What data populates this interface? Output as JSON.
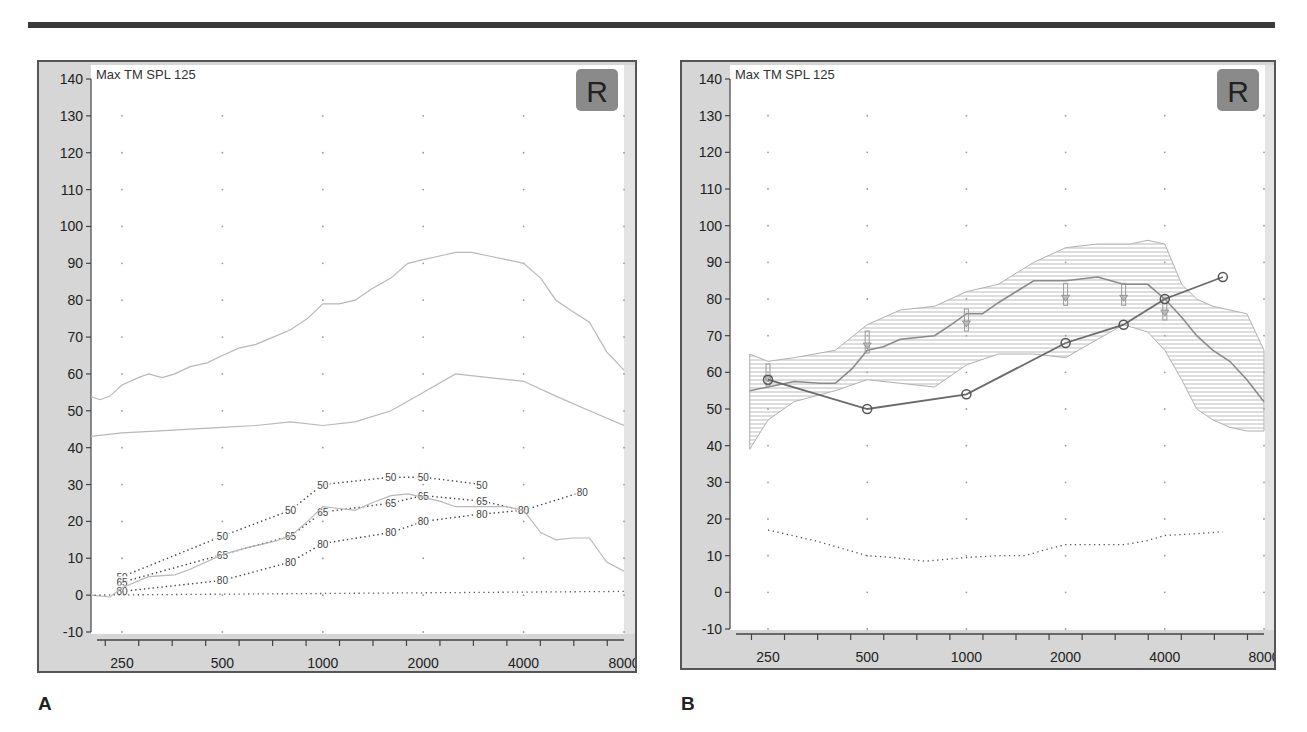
{
  "figure": {
    "panel_labels": [
      "A",
      "B"
    ]
  },
  "chart_data": [
    {
      "type": "line",
      "panel": "A",
      "title": "Max TM SPL 125",
      "badge": "R",
      "xlabel": "",
      "ylabel": "",
      "x_scale": "log2",
      "x_ticks": [
        250,
        500,
        1000,
        2000,
        4000,
        8000
      ],
      "y_ticks": [
        140,
        130,
        120,
        110,
        100,
        90,
        80,
        70,
        60,
        50,
        40,
        30,
        20,
        10,
        0,
        -10
      ],
      "ylim": [
        -10,
        140
      ],
      "grid": "dotted points",
      "series": [
        {
          "name": "upper-range",
          "style": "solid-light",
          "x": [
            200,
            215,
            230,
            250,
            280,
            300,
            330,
            360,
            400,
            450,
            500,
            560,
            630,
            710,
            800,
            900,
            1000,
            1120,
            1250,
            1400,
            1600,
            1800,
            2000,
            2240,
            2500,
            2800,
            3150,
            3550,
            4000,
            4500,
            5000,
            5600,
            6300,
            7100,
            8000
          ],
          "y": [
            54,
            53,
            54,
            57,
            59,
            60,
            59,
            60,
            62,
            63,
            65,
            67,
            68,
            70,
            72,
            75,
            79,
            79,
            80,
            83,
            86,
            90,
            91,
            92,
            93,
            93,
            92,
            91,
            90,
            86,
            80,
            77,
            74,
            66,
            61
          ]
        },
        {
          "name": "lower-range",
          "style": "solid-light",
          "x": [
            200,
            250,
            315,
            400,
            500,
            630,
            800,
            1000,
            1250,
            1600,
            2000,
            2500,
            3150,
            4000,
            5000,
            6300,
            8000
          ],
          "y": [
            43,
            44,
            44.5,
            45,
            45.5,
            46,
            47,
            46,
            47,
            50,
            55,
            60,
            59,
            58,
            54,
            50,
            46
          ]
        },
        {
          "name": "SPL 50",
          "style": "dotted-labeled",
          "label": "50",
          "x": [
            250,
            500,
            800,
            1000,
            1600,
            2000,
            3000
          ],
          "y": [
            5,
            16,
            23,
            30,
            32,
            32,
            30
          ]
        },
        {
          "name": "SPL 65",
          "style": "dotted-labeled",
          "label": "65",
          "x": [
            250,
            500,
            800,
            1000,
            1600,
            2000,
            3000,
            4000
          ],
          "y": [
            3.5,
            11,
            16,
            22.5,
            25,
            27,
            25.5,
            23
          ]
        },
        {
          "name": "SPL 80",
          "style": "dotted-labeled",
          "label": "80",
          "x": [
            250,
            500,
            800,
            1000,
            1600,
            2000,
            3000,
            4000,
            6000
          ],
          "y": [
            1,
            4,
            9,
            14,
            17,
            20,
            22,
            23,
            28
          ]
        },
        {
          "name": "threshold-curve",
          "style": "solid-light",
          "x": [
            200,
            230,
            250,
            300,
            360,
            400,
            500,
            600,
            710,
            800,
            900,
            1000,
            1120,
            1250,
            1400,
            1600,
            1800,
            2000,
            2240,
            2500,
            2800,
            3150,
            3550,
            4000,
            4500,
            5000,
            5600,
            6300,
            7100,
            8000
          ],
          "y": [
            0,
            -0.5,
            2,
            5,
            5.5,
            7,
            11,
            13,
            14.5,
            16,
            20,
            24,
            23.5,
            23,
            25,
            27,
            27.5,
            26.5,
            25.5,
            24,
            24,
            24,
            24,
            23,
            17,
            15,
            15.5,
            15.5,
            9,
            6.5
          ]
        },
        {
          "name": "baseline-0",
          "style": "dotted",
          "x": [
            200,
            8000
          ],
          "y": [
            0,
            1
          ]
        }
      ]
    },
    {
      "type": "line",
      "panel": "B",
      "title": "Max TM SPL 125",
      "badge": "R",
      "xlabel": "",
      "ylabel": "",
      "x_scale": "log2",
      "x_ticks": [
        250,
        500,
        1000,
        2000,
        4000,
        8000
      ],
      "y_ticks": [
        140,
        130,
        120,
        110,
        100,
        90,
        80,
        70,
        60,
        50,
        40,
        30,
        20,
        10,
        0,
        -10
      ],
      "ylim": [
        -10,
        140
      ],
      "grid": "dotted points",
      "series": [
        {
          "name": "target-range-upper",
          "style": "hatched-band-top",
          "x": [
            220,
            250,
            300,
            400,
            500,
            630,
            800,
            1000,
            1250,
            1600,
            2000,
            2500,
            3150,
            3550,
            4000,
            4500,
            5000,
            5600,
            6300,
            7100,
            8000
          ],
          "y": [
            65,
            63,
            64,
            66,
            73,
            77,
            78,
            82,
            84,
            90,
            94,
            95,
            95,
            96,
            95,
            84,
            80,
            78,
            77,
            76,
            66
          ]
        },
        {
          "name": "target-range-lower",
          "style": "hatched-band-bottom",
          "x": [
            220,
            250,
            300,
            400,
            500,
            630,
            800,
            1000,
            1250,
            1600,
            2000,
            2500,
            3000,
            3550,
            4000,
            4500,
            5000,
            5600,
            6300,
            7100,
            8000
          ],
          "y": [
            39,
            47,
            52,
            55,
            58,
            57,
            56,
            62,
            65,
            65,
            64,
            69,
            73,
            71,
            66,
            58,
            50,
            47,
            45,
            44,
            44
          ]
        },
        {
          "name": "measured-response",
          "style": "solid",
          "x": [
            220,
            250,
            300,
            360,
            400,
            450,
            500,
            560,
            630,
            800,
            900,
            1000,
            1120,
            1250,
            1600,
            1800,
            2000,
            2500,
            3000,
            3550,
            4000,
            4500,
            5000,
            5600,
            6300,
            7100,
            8000
          ],
          "y": [
            55,
            56,
            57.5,
            57,
            57,
            61,
            66,
            67,
            69,
            70,
            73,
            76,
            76,
            79,
            85,
            85,
            85,
            86,
            84,
            84,
            80,
            75,
            70,
            66,
            63,
            58,
            52
          ]
        },
        {
          "name": "target-arrows",
          "style": "arrow-markers",
          "x": [
            250,
            500,
            1000,
            2000,
            3000,
            4000
          ],
          "y": [
            59,
            68,
            74,
            81,
            81,
            77
          ]
        },
        {
          "name": "thresholds",
          "style": "solid-circles",
          "x": [
            250,
            500,
            1000,
            2000,
            3000,
            4000,
            6000
          ],
          "y": [
            58,
            50,
            54,
            68,
            73,
            80,
            86
          ]
        },
        {
          "name": "noise-floor",
          "style": "dotted",
          "x": [
            250,
            350,
            500,
            600,
            750,
            1000,
            1250,
            1500,
            1800,
            2000,
            2500,
            3000,
            3500,
            4000,
            5000,
            6000
          ],
          "y": [
            17,
            14,
            10,
            9.5,
            8.5,
            9.5,
            10,
            10,
            12,
            13,
            13,
            13,
            14,
            15.5,
            16,
            16.5
          ]
        }
      ]
    }
  ],
  "colors": {
    "axis_strip": "#d6d6d6",
    "frame": "#555555",
    "badge_bg": "#8a8a8a",
    "badge_text": "#222222",
    "light_line": "#b8b8b8",
    "dark_line": "#6a6a6a",
    "dotted": "#555555",
    "hatch": "#aaaaaa"
  }
}
